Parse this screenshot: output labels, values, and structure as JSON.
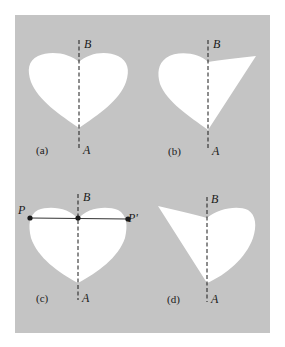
{
  "figure": {
    "panels": [
      {
        "id": "a",
        "caption": "(a)",
        "axis_top": "B",
        "axis_bottom": "A",
        "shape": "symmetric heart"
      },
      {
        "id": "b",
        "caption": "(b)",
        "axis_top": "B",
        "axis_bottom": "A",
        "shape": "heart with right lobe replaced by pointed wedge"
      },
      {
        "id": "c",
        "caption": "(c)",
        "axis_top": "B",
        "axis_bottom": "A",
        "shape": "symmetric heart with chord",
        "points": {
          "left": "P",
          "right": "P'"
        }
      },
      {
        "id": "d",
        "caption": "(d)",
        "axis_top": "B",
        "axis_bottom": "A",
        "shape": "heart with left lobe replaced by pointed wedge"
      }
    ],
    "colors": {
      "background": "#c4c4c4",
      "shape": "#ffffff",
      "ink": "#1a1a1a"
    }
  }
}
